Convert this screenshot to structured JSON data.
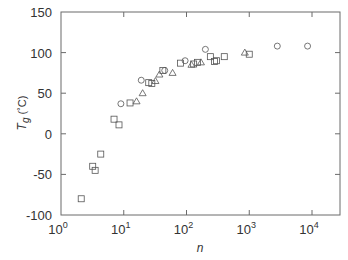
{
  "chart_data": {
    "type": "scatter",
    "title": "",
    "xlabel": "n",
    "ylabel": "T_g (°C)",
    "ylabel_main": "T",
    "ylabel_sub": "g",
    "ylabel_unit": "(˚C)",
    "xscale": "log",
    "xlim": [
      1,
      25000
    ],
    "ylim": [
      -100,
      150
    ],
    "xticks": [
      1,
      10,
      100,
      1000,
      10000
    ],
    "xtick_labels": [
      {
        "base": "10",
        "exp": "0"
      },
      {
        "base": "10",
        "exp": "1"
      },
      {
        "base": "10",
        "exp": "2"
      },
      {
        "base": "10",
        "exp": "3"
      },
      {
        "base": "10",
        "exp": "4"
      }
    ],
    "yticks": [
      -100,
      -50,
      0,
      50,
      100,
      150
    ],
    "ytick_labels": [
      "-100",
      "-50",
      "0",
      "50",
      "100",
      "150"
    ],
    "grid": false,
    "legend": null,
    "series": [
      {
        "name": "squares",
        "marker": "square",
        "points": [
          [
            2.1,
            -80
          ],
          [
            3.2,
            -40
          ],
          [
            3.5,
            -45
          ],
          [
            4.3,
            -25
          ],
          [
            7,
            18
          ],
          [
            8.4,
            11
          ],
          [
            12.6,
            38
          ],
          [
            25,
            63
          ],
          [
            28,
            62
          ],
          [
            42,
            78
          ],
          [
            80,
            87
          ],
          [
            130,
            86
          ],
          [
            150,
            88
          ],
          [
            240,
            95
          ],
          [
            280,
            89
          ],
          [
            300,
            90
          ],
          [
            400,
            95
          ],
          [
            1000,
            98
          ]
        ]
      },
      {
        "name": "circles",
        "marker": "circle",
        "points": [
          [
            9,
            37
          ],
          [
            19,
            66
          ],
          [
            45,
            78
          ],
          [
            95,
            90
          ],
          [
            200,
            104
          ],
          [
            2800,
            108
          ],
          [
            8500,
            108
          ]
        ]
      },
      {
        "name": "triangles",
        "marker": "triangle",
        "points": [
          [
            16,
            40
          ],
          [
            20,
            50
          ],
          [
            32,
            65
          ],
          [
            37,
            73
          ],
          [
            60,
            75
          ],
          [
            120,
            85
          ],
          [
            170,
            88
          ],
          [
            850,
            100
          ]
        ]
      }
    ]
  }
}
